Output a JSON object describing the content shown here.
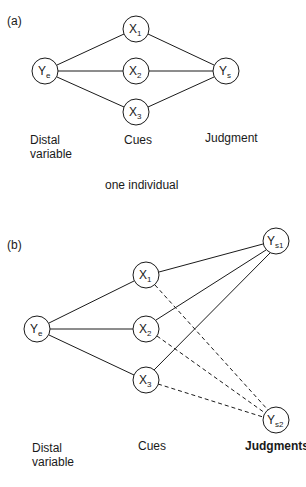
{
  "panel_a": {
    "label": "(a)",
    "nodes": {
      "ye": {
        "main": "Y",
        "sub": "e"
      },
      "x1": {
        "main": "X",
        "sub": "1"
      },
      "x2": {
        "main": "X",
        "sub": "2"
      },
      "x3": {
        "main": "X",
        "sub": "3"
      },
      "ys": {
        "main": "Y",
        "sub": "s"
      }
    },
    "column_labels": {
      "distal_line1": "Distal",
      "distal_line2": "variable",
      "cues": "Cues",
      "judgment": "Judgment"
    },
    "caption": "one individual"
  },
  "panel_b": {
    "label": "(b)",
    "nodes": {
      "ye": {
        "main": "Y",
        "sub": "e"
      },
      "x1": {
        "main": "X",
        "sub": "1"
      },
      "x2": {
        "main": "X",
        "sub": "2"
      },
      "x3": {
        "main": "X",
        "sub": "3"
      },
      "ys1": {
        "main": "Y",
        "sub": "s1"
      },
      "ys2": {
        "main": "Y",
        "sub": "s2"
      }
    },
    "column_labels": {
      "distal_line1": "Distal",
      "distal_line2": "variable",
      "cues": "Cues",
      "judgments": "Judgments"
    }
  },
  "colors": {
    "stroke": "#1a1a1a",
    "background": "#ffffff"
  }
}
